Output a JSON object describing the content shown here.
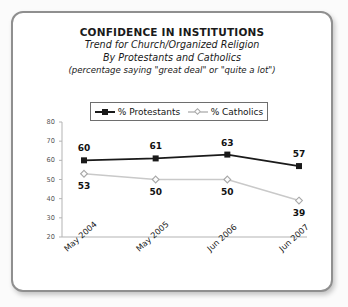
{
  "card": {
    "border_color": "#8f8f8f",
    "background": "#ffffff"
  },
  "header": {
    "title": "CONFIDENCE IN INSTITUTIONS",
    "subtitle_1": "Trend for Church/Organized Religion",
    "subtitle_2": "By Protestants and Catholics",
    "subtitle_3": "(percentage saying \"great deal\" or \"quite a lot\")"
  },
  "legend": {
    "position": "top-center",
    "entries": [
      {
        "label": "% Protestants",
        "color": "#1a1a1a",
        "marker": "filled-square"
      },
      {
        "label": "% Catholics",
        "color": "#c9c9c9",
        "marker": "open-diamond"
      }
    ]
  },
  "chart_data": {
    "type": "line",
    "title": "CONFIDENCE IN INSTITUTIONS",
    "subtitle": "Trend for Church/Organized Religion By Protestants and Catholics (percentage saying \"great deal\" or \"quite a lot\")",
    "xlabel": "",
    "ylabel": "",
    "categories": [
      "May 2004",
      "May 2005",
      "Jun 2006",
      "Jun 2007"
    ],
    "series": [
      {
        "name": "% Protestants",
        "values": [
          60,
          61,
          63,
          57
        ],
        "color": "#1a1a1a",
        "marker": "filled-square",
        "label_position": "above"
      },
      {
        "name": "% Catholics",
        "values": [
          53,
          50,
          50,
          39
        ],
        "color": "#c9c9c9",
        "marker": "open-diamond",
        "label_position": "below"
      }
    ],
    "ylim": [
      20,
      80
    ],
    "yticks": [
      20,
      30,
      40,
      50,
      60,
      70,
      80
    ],
    "ytick_labels": [
      "20",
      "30",
      "40",
      "50",
      "60",
      "70",
      "80"
    ],
    "grid": false,
    "legend_position": "top-center",
    "xtick_rotation": -42
  }
}
